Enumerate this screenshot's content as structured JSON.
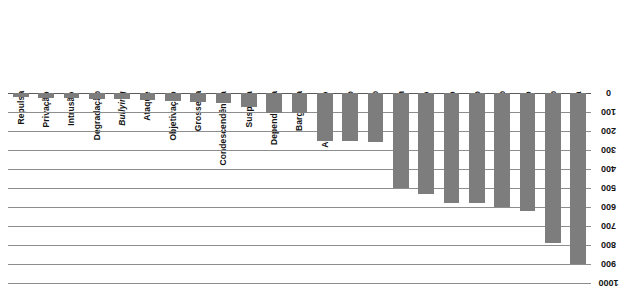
{
  "chart_data": {
    "type": "bar",
    "title": "",
    "subtitle": "",
    "xlabel": "",
    "ylabel": "",
    "orientation": "vertical-inverted",
    "note": "Bars descend downward from a zero axis at the top; category labels and axis tick labels are rotated 180 degrees.",
    "grid": true,
    "legend": false,
    "ylim": [
      0,
      1000
    ],
    "yticks": [
      0,
      100,
      200,
      300,
      400,
      500,
      600,
      700,
      800,
      900,
      1000
    ],
    "ytick_labels": [
      "0",
      "100",
      "200",
      "300",
      "400",
      "500",
      "600",
      "700",
      "800",
      "900",
      "1000"
    ],
    "categories": [
      "Repulsa",
      "Privação",
      "Intrusão",
      "Degradação",
      "Bullying",
      "Ataque",
      "Objetivação",
      "Grosseria",
      "Condescendência",
      "Suspeita",
      "Dependência",
      "Barganha",
      "Agrupamento",
      "Difamação",
      "Exploração",
      "Rotulagem",
      "Discriminação",
      "Exclusão",
      "Desprezo",
      "Restrição",
      "Dominuído",
      "Rejeição",
      "Indiferença"
    ],
    "italic_categories": [
      "Bullying"
    ],
    "values": [
      20,
      25,
      25,
      30,
      30,
      35,
      40,
      45,
      55,
      75,
      105,
      105,
      250,
      250,
      260,
      500,
      530,
      580,
      580,
      600,
      620,
      790,
      900
    ],
    "bar_color": "#7d7d7d",
    "gridline_color": "#8d8d8d",
    "axis_color": "#5a5a5a",
    "background_color": "#ffffff"
  }
}
